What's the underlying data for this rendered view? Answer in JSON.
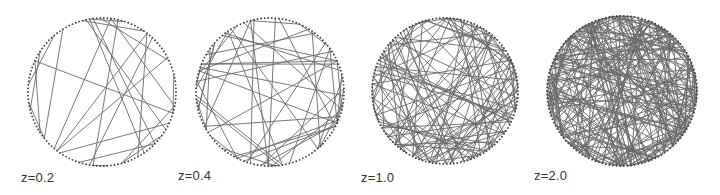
{
  "figure": {
    "nodes_per_circle": 130,
    "chord_color": "#6a6a6a",
    "node_color": "#444444",
    "panels": [
      {
        "label": "z=0.2",
        "z": 0.2,
        "edges": 25,
        "cx": 102,
        "cy": 92,
        "r": 74,
        "label_x": 21,
        "label_y": 171,
        "seed": 11
      },
      {
        "label": "z=0.4",
        "z": 0.4,
        "edges": 50,
        "cx": 270,
        "cy": 92,
        "r": 74,
        "label_x": 178,
        "label_y": 169,
        "seed": 23
      },
      {
        "label": "z=1.0",
        "z": 1.0,
        "edges": 120,
        "cx": 445,
        "cy": 91,
        "r": 73,
        "label_x": 361,
        "label_y": 171,
        "seed": 37
      },
      {
        "label": "z=2.0",
        "z": 2.0,
        "edges": 240,
        "cx": 622,
        "cy": 91,
        "r": 75,
        "label_x": 534,
        "label_y": 169,
        "seed": 53
      }
    ]
  }
}
